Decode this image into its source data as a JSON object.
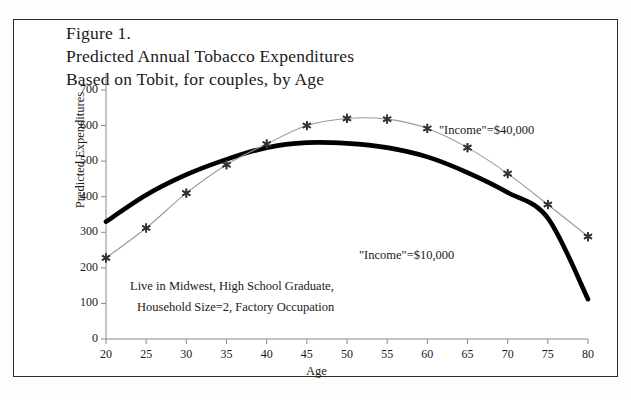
{
  "figure": {
    "title_lines": [
      "Figure 1.",
      "Predicted Annual Tobacco Expenditures",
      "Based on Tobit, for couples, by Age"
    ],
    "note_lines": [
      "Live in Midwest, High School Graduate,",
      "Household Size=2, Factory Occupation"
    ],
    "frame_color": "#2b2b2b",
    "background": "#ffffff"
  },
  "chart_data": {
    "type": "line",
    "title": "Predicted Annual Tobacco Expenditures Based on Tobit, for couples, by Age",
    "xlabel": "Age",
    "ylabel": "Predicted Expenditures",
    "x": [
      20,
      25,
      30,
      35,
      40,
      45,
      50,
      55,
      60,
      65,
      70,
      75,
      80
    ],
    "xlim": [
      20,
      80
    ],
    "ylim": [
      0,
      700
    ],
    "xticks": [
      20,
      25,
      30,
      35,
      40,
      45,
      50,
      55,
      60,
      65,
      70,
      75,
      80
    ],
    "yticks": [
      0,
      100,
      200,
      300,
      400,
      500,
      600,
      700
    ],
    "grid": false,
    "legend": "inline-annotations",
    "series": [
      {
        "name": "\"Income\"=$40,000",
        "marker": "asterisk",
        "line_style": "thin",
        "color": "#333333",
        "label_x": 50,
        "label_y": 645,
        "values": [
          228,
          312,
          410,
          490,
          548,
          600,
          620,
          618,
          592,
          538,
          465,
          378,
          288
        ]
      },
      {
        "name": "\"Income\"=$10,000",
        "marker": "none",
        "line_style": "thick",
        "color": "#000000",
        "label_x": 58,
        "label_y": 252,
        "values": [
          330,
          405,
          462,
          505,
          538,
          552,
          550,
          538,
          512,
          468,
          412,
          340,
          112
        ]
      }
    ],
    "annotations": [
      {
        "text": "\"Income\"=$40,000"
      },
      {
        "text": "\"Income\"=$10,000"
      },
      {
        "text": "Live in Midwest, High School Graduate,"
      },
      {
        "text": "Household Size=2, Factory Occupation"
      }
    ]
  },
  "axes": {
    "y_tick_labels": [
      "700",
      "600",
      "500",
      "400",
      "300",
      "200",
      "100",
      "0"
    ],
    "x_tick_labels": [
      "20",
      "25",
      "30",
      "35",
      "40",
      "45",
      "50",
      "55",
      "60",
      "65",
      "70",
      "75",
      "80"
    ],
    "x_title": "Age",
    "y_title": "Predicted Expenditures"
  }
}
